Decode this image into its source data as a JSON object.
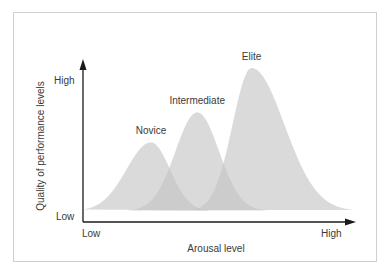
{
  "chart_data": {
    "type": "area",
    "title": "",
    "xlabel": "Arousal level",
    "ylabel": "Quality of performance levels",
    "x_ticks": [
      "Low",
      "High"
    ],
    "y_ticks": [
      "Low",
      "High"
    ],
    "xlim": [
      0,
      1
    ],
    "ylim": [
      0,
      1
    ],
    "grid": false,
    "legend": "none",
    "series": [
      {
        "name": "Novice",
        "peak_x": 0.25,
        "peak_y": 0.48,
        "spread_left": 0.09,
        "spread_right": 0.07
      },
      {
        "name": "Intermediate",
        "peak_x": 0.42,
        "peak_y": 0.69,
        "spread_left": 0.08,
        "spread_right": 0.08
      },
      {
        "name": "Elite",
        "peak_x": 0.62,
        "peak_y": 1.0,
        "spread_left": 0.07,
        "spread_right": 0.12
      }
    ]
  },
  "colors": {
    "fill": "#d9d9d9",
    "axis": "#1a1a1a",
    "text": "#3a3a3a",
    "frame": "#cfcfcf"
  }
}
